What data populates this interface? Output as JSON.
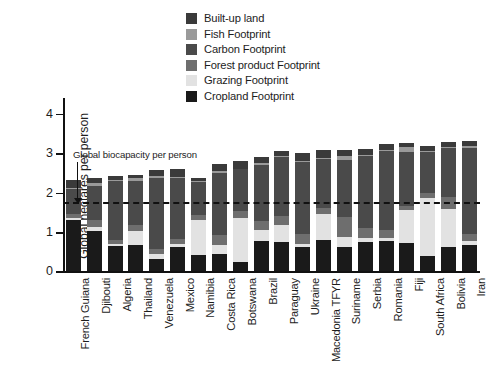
{
  "chart_data": {
    "type": "bar",
    "subtype": "stacked-bar",
    "title": "",
    "xlabel": "",
    "ylabel": "Global hectares per person",
    "ylim": [
      0,
      4.4
    ],
    "yticks": [
      0,
      1,
      2,
      3,
      4
    ],
    "ytick_labels": [
      "0",
      "1",
      "2",
      "3",
      "4"
    ],
    "grid": false,
    "legend_position": "top-center",
    "categories": [
      "French Guiana",
      "Djibouti",
      "Algeria",
      "Thailand",
      "Venezuela",
      "Mexico",
      "Namibia",
      "Costa Rica",
      "Botswana",
      "Brazil",
      "Paraguay",
      "Ukraine",
      "Macedonia TFYR",
      "Suriname",
      "Serbia",
      "Romania",
      "Fiji",
      "South Africa",
      "Bolivia",
      "Iran"
    ],
    "series": [
      {
        "name": "Cropland Footprint",
        "color": "#1a1a1a",
        "values": [
          1.3,
          1.02,
          0.64,
          0.67,
          0.31,
          0.62,
          0.42,
          0.44,
          0.25,
          0.78,
          0.75,
          0.63,
          0.79,
          0.62,
          0.74,
          0.77,
          0.72,
          0.38,
          0.63,
          0.68
        ]
      },
      {
        "name": "Grazing Footprint",
        "color": "#e2e2e2",
        "values": [
          0.06,
          0.11,
          0.05,
          0.36,
          0.13,
          0.08,
          0.88,
          0.22,
          1.1,
          0.28,
          0.42,
          0.06,
          0.66,
          0.25,
          0.1,
          0.07,
          0.84,
          1.48,
          0.95,
          0.08
        ]
      },
      {
        "name": "Forest product Footprint",
        "color": "#6e6e6e",
        "values": [
          0.1,
          0.17,
          0.1,
          0.15,
          0.14,
          0.13,
          0.12,
          0.26,
          0.18,
          0.22,
          0.24,
          0.26,
          0.16,
          0.5,
          0.26,
          0.22,
          0.1,
          0.14,
          0.3,
          0.18
        ]
      },
      {
        "name": "Carbon Footprint",
        "color": "#4a4a4a",
        "values": [
          0.62,
          0.88,
          1.5,
          1.12,
          1.78,
          1.53,
          0.84,
          1.57,
          1.06,
          1.42,
          1.5,
          1.82,
          1.24,
          1.46,
          1.83,
          2.0,
          1.37,
          1.02,
          1.25,
          2.2
        ]
      },
      {
        "name": "Fish Footprint",
        "color": "#9a9a9a",
        "values": [
          0.04,
          0.06,
          0.03,
          0.08,
          0.06,
          0.03,
          0.03,
          0.05,
          0.02,
          0.04,
          0.02,
          0.04,
          0.03,
          0.1,
          0.03,
          0.03,
          0.12,
          0.04,
          0.02,
          0.05
        ]
      },
      {
        "name": "Built-up land",
        "color": "#3a3a3a",
        "values": [
          0.2,
          0.14,
          0.1,
          0.07,
          0.16,
          0.22,
          0.09,
          0.18,
          0.19,
          0.16,
          0.12,
          0.19,
          0.19,
          0.16,
          0.15,
          0.14,
          0.1,
          0.12,
          0.14,
          0.13
        ]
      }
    ],
    "annotations": [
      {
        "label": "Global biocapacity per person",
        "type": "hline",
        "value": 1.7,
        "style": "dashed"
      }
    ]
  },
  "legend": {
    "items": [
      {
        "label": "Built-up land",
        "color": "#3a3a3a"
      },
      {
        "label": "Fish Footprint",
        "color": "#9a9a9a"
      },
      {
        "label": "Carbon Footprint",
        "color": "#4a4a4a"
      },
      {
        "label": "Forest product Footprint",
        "color": "#6e6e6e"
      },
      {
        "label": "Grazing Footprint",
        "color": "#e2e2e2"
      },
      {
        "label": "Cropland Footprint",
        "color": "#1a1a1a"
      }
    ]
  }
}
